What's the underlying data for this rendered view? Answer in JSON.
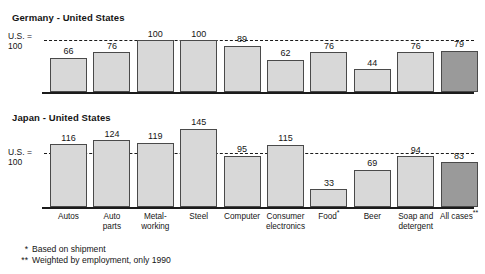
{
  "chart_data": {
    "type": "bar",
    "title": "",
    "categories": [
      "Autos",
      "Auto\nparts",
      "Metal-\nworking",
      "Steel",
      "Computer",
      "Consumer\nelectronics",
      "Food*",
      "Beer",
      "Soap and\ndetergent",
      "All cases**"
    ],
    "series": [
      {
        "name": "Germany - United States",
        "values": [
          66,
          76,
          100,
          100,
          89,
          62,
          76,
          44,
          76,
          79
        ]
      },
      {
        "name": "Japan - United States",
        "values": [
          116,
          124,
          119,
          145,
          95,
          115,
          33,
          69,
          94,
          83
        ]
      }
    ],
    "reference_line": 100,
    "reference_label": "U.S. =\n100",
    "ylabel": "",
    "xlabel": "",
    "ylim": [
      0,
      160
    ],
    "grid": false,
    "legend_position": "none",
    "annotations": [
      "* Based on shipment",
      "** Weighted by employment, only 1990"
    ],
    "colors": {
      "bar_fill": "#d8d8d8",
      "bar_highlight_fill": "#9a9a9a",
      "bar_stroke": "#4a4a4a",
      "axis": "#1b1b1b",
      "text": "#151515"
    }
  },
  "panels": [
    {
      "id": "germany",
      "title": "Germany - United States",
      "axis_label_line1": "U.S. =",
      "axis_label_line2": "100",
      "values": [
        66,
        76,
        100,
        100,
        89,
        62,
        76,
        44,
        76,
        79
      ],
      "labels": [
        "66",
        "76",
        "100",
        "100",
        "89",
        "62",
        "76",
        "44",
        "76",
        "79"
      ],
      "highlight_index": 9
    },
    {
      "id": "japan",
      "title": "Japan - United States",
      "axis_label_line1": "U.S. =",
      "axis_label_line2": "100",
      "values": [
        116,
        124,
        119,
        145,
        95,
        115,
        33,
        69,
        94,
        83
      ],
      "labels": [
        "116",
        "124",
        "119",
        "145",
        "95",
        "115",
        "33",
        "69",
        "94",
        "83"
      ],
      "highlight_index": 9
    }
  ],
  "categories": [
    {
      "line1": "Autos",
      "line2": "",
      "mark": ""
    },
    {
      "line1": "Auto",
      "line2": "parts",
      "mark": ""
    },
    {
      "line1": "Metal-",
      "line2": "working",
      "mark": ""
    },
    {
      "line1": "Steel",
      "line2": "",
      "mark": ""
    },
    {
      "line1": "Computer",
      "line2": "",
      "mark": ""
    },
    {
      "line1": "Consumer",
      "line2": "electronics",
      "mark": ""
    },
    {
      "line1": "Food",
      "line2": "",
      "mark": "*"
    },
    {
      "line1": "Beer",
      "line2": "",
      "mark": ""
    },
    {
      "line1": "Soap and",
      "line2": "detergent",
      "mark": ""
    },
    {
      "line1": "All cases",
      "line2": "",
      "mark": "**"
    }
  ],
  "footnotes": [
    {
      "mark": "*",
      "text": "Based on shipment"
    },
    {
      "mark": "**",
      "text": "Weighted by employment, only 1990"
    }
  ]
}
